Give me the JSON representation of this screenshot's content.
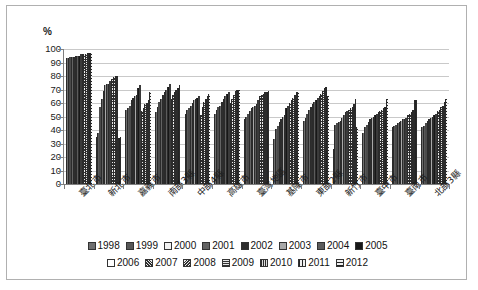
{
  "chart": {
    "type": "bar",
    "y_axis_title": "%",
    "frame_border_color": "#b0b0b0",
    "gridline_color": "#c9c9c9",
    "axis_color": "#7f7f7f"
  },
  "chart_data": {
    "type": "bar",
    "title": "",
    "subtitle": "",
    "xlabel": "",
    "ylabel": "%",
    "ylim": [
      0,
      100
    ],
    "yticks": [
      0,
      10,
      20,
      30,
      40,
      50,
      60,
      70,
      80,
      90,
      100
    ],
    "grid": true,
    "legend_position": "bottom",
    "categories": [
      "臺北市",
      "新北市",
      "嘉義市",
      "南部3縣",
      "中部4縣",
      "高雄市",
      "臺灣地區",
      "基隆市",
      "東部2縣",
      "新竹市",
      "臺中市",
      "臺南市",
      "北部3縣"
    ],
    "series": [
      {
        "name": "1998",
        "values": [
          93,
          35,
          55,
          53,
          52,
          52,
          48,
          33,
          47,
          26,
          38,
          42,
          42
        ]
      },
      {
        "name": "1999",
        "values": [
          93,
          38,
          56,
          57,
          55,
          55,
          50,
          41,
          49,
          44,
          42,
          43,
          43
        ]
      },
      {
        "name": "2000",
        "values": [
          94,
          57,
          58,
          61,
          56,
          57,
          52,
          43,
          52,
          45,
          44,
          44,
          45
        ]
      },
      {
        "name": "2001",
        "values": [
          94,
          63,
          62,
          63,
          58,
          58,
          54,
          46,
          55,
          46,
          46,
          45,
          47
        ]
      },
      {
        "name": "2002",
        "values": [
          94,
          69,
          64,
          66,
          60,
          61,
          56,
          48,
          57,
          47,
          48,
          46,
          48
        ]
      },
      {
        "name": "2003",
        "values": [
          95,
          73,
          65,
          68,
          62,
          63,
          57,
          50,
          59,
          49,
          49,
          47,
          49
        ]
      },
      {
        "name": "2004",
        "values": [
          95,
          74,
          66,
          70,
          63,
          65,
          58,
          51,
          61,
          51,
          50,
          48,
          50
        ]
      },
      {
        "name": "2005",
        "values": [
          95,
          74,
          71,
          72,
          64,
          67,
          59,
          56,
          62,
          53,
          51,
          48,
          51
        ]
      },
      {
        "name": "2006",
        "values": [
          96,
          76,
          73,
          74,
          65,
          68,
          62,
          58,
          64,
          54,
          52,
          49,
          52
        ]
      },
      {
        "name": "2007",
        "values": [
          96,
          78,
          54,
          63,
          51,
          60,
          65,
          60,
          65,
          55,
          53,
          51,
          54
        ]
      },
      {
        "name": "2008",
        "values": [
          96,
          79,
          56,
          66,
          57,
          63,
          66,
          62,
          67,
          56,
          54,
          52,
          55
        ]
      },
      {
        "name": "2009",
        "values": [
          96,
          80,
          59,
          68,
          61,
          66,
          67,
          64,
          69,
          57,
          55,
          53,
          57
        ]
      },
      {
        "name": "2010",
        "values": [
          97,
          80,
          60,
          70,
          63,
          69,
          68,
          66,
          71,
          59,
          56,
          55,
          58
        ]
      },
      {
        "name": "2011",
        "values": [
          97,
          34,
          62,
          71,
          65,
          70,
          68,
          68,
          72,
          63,
          57,
          62,
          61
        ]
      },
      {
        "name": "2012",
        "values": [
          97,
          35,
          68,
          73,
          67,
          70,
          69,
          68,
          65,
          42,
          63,
          62,
          63
        ]
      }
    ]
  },
  "legend": {
    "row1": [
      "1998",
      "1999",
      "2000",
      "2001",
      "2002",
      "2003",
      "2004",
      "2005"
    ],
    "row2": [
      "2006",
      "2007",
      "2008",
      "2009",
      "2010",
      "2011",
      "2012"
    ]
  }
}
